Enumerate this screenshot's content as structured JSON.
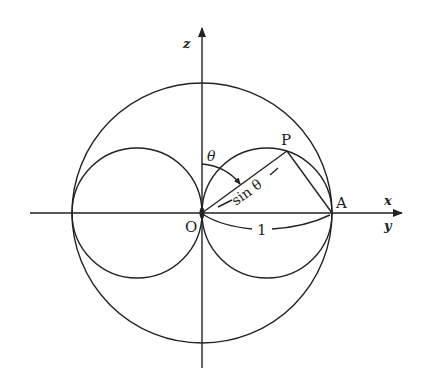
{
  "diagram": {
    "type": "geometry",
    "colors": {
      "ink": "#222222",
      "background": "#ffffff"
    },
    "axes": {
      "horizontal_label_top": "x",
      "horizontal_label_bottom": "y",
      "vertical_label": "z"
    },
    "points": {
      "origin": "O",
      "point_p": "P",
      "point_a": "A"
    },
    "annotations": {
      "angle": "θ",
      "chord_length": "sin θ",
      "radius_length": "1"
    },
    "shapes": {
      "outer_circle": {
        "cx": 202,
        "cy": 213,
        "r": 130
      },
      "left_lobe": {
        "cx": 137,
        "cy": 213,
        "r": 65
      },
      "right_lobe": {
        "cx": 267,
        "cy": 213,
        "r": 65
      }
    }
  }
}
